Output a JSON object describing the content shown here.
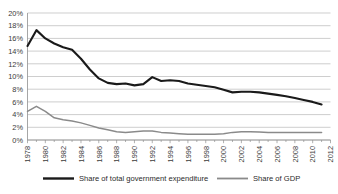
{
  "chart_data": {
    "type": "line",
    "title": "",
    "subtitle": "",
    "xlabel": "",
    "ylabel": "",
    "ylim": [
      0,
      20
    ],
    "yticks": [
      "0%",
      "2%",
      "4%",
      "6%",
      "8%",
      "10%",
      "12%",
      "14%",
      "16%",
      "18%",
      "20%"
    ],
    "ytick_values": [
      0,
      2,
      4,
      6,
      8,
      10,
      12,
      14,
      16,
      18,
      20
    ],
    "xlim": [
      1978,
      2012
    ],
    "xticks": [
      "1978",
      "1980",
      "1982",
      "1984",
      "1986",
      "1988",
      "1990",
      "1992",
      "1994",
      "1996",
      "1998",
      "2000",
      "2002",
      "2004",
      "2006",
      "2008",
      "2010",
      "2012"
    ],
    "xtick_values": [
      1978,
      1980,
      1982,
      1984,
      1986,
      1988,
      1990,
      1992,
      1994,
      1996,
      1998,
      2000,
      2002,
      2004,
      2006,
      2008,
      2010,
      2012
    ],
    "grid": true,
    "grid_axis": "y",
    "legend_position": "bottom",
    "unit": "percent",
    "x": [
      1978,
      1979,
      1980,
      1981,
      1982,
      1983,
      1984,
      1985,
      1986,
      1987,
      1988,
      1989,
      1990,
      1991,
      1992,
      1993,
      1994,
      1995,
      1996,
      1997,
      1998,
      1999,
      2000,
      2001,
      2002,
      2003,
      2004,
      2005,
      2006,
      2007,
      2008,
      2009,
      2010,
      2011
    ],
    "series": [
      {
        "name": "Share of total government expenditure",
        "color": "#1a1a1a",
        "width": 2.1,
        "values": [
          14.8,
          17.3,
          16.0,
          15.2,
          14.6,
          14.2,
          12.8,
          11.1,
          9.7,
          9.0,
          8.8,
          8.9,
          8.6,
          8.8,
          9.9,
          9.3,
          9.4,
          9.3,
          8.9,
          8.7,
          8.5,
          8.3,
          7.9,
          7.5,
          7.6,
          7.6,
          7.5,
          7.3,
          7.1,
          6.9,
          6.6,
          6.3,
          6.0,
          5.6
        ]
      },
      {
        "name": "Share of GDP",
        "color": "#8a8a8a",
        "width": 1.5,
        "values": [
          4.5,
          5.3,
          4.5,
          3.5,
          3.2,
          3.0,
          2.7,
          2.3,
          1.9,
          1.6,
          1.3,
          1.2,
          1.3,
          1.4,
          1.4,
          1.2,
          1.1,
          1.0,
          0.9,
          0.9,
          0.9,
          0.9,
          1.0,
          1.2,
          1.3,
          1.3,
          1.25,
          1.2,
          1.2,
          1.2,
          1.2,
          1.2,
          1.2,
          1.2
        ]
      }
    ],
    "legend": [
      {
        "label": "Share of total government expenditure",
        "color": "#1a1a1a",
        "width": 2.4
      },
      {
        "label": "Share of GDP",
        "color": "#8a8a8a",
        "width": 1.8
      }
    ]
  }
}
